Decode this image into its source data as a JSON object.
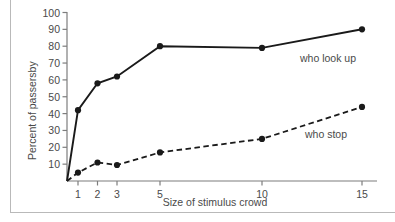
{
  "chart_data": {
    "type": "line",
    "title": "",
    "xlabel": "Size of stimulus crowd",
    "ylabel": "Percent of passersby",
    "x": [
      1,
      2,
      3,
      5,
      10,
      15
    ],
    "xtick_labels": [
      "1",
      "2",
      "3",
      "5",
      "10",
      "15"
    ],
    "ytick_labels": [
      "10",
      "20",
      "30",
      "40",
      "50",
      "60",
      "70",
      "80",
      "90",
      "100"
    ],
    "ylim": [
      0,
      100
    ],
    "grid": false,
    "legend_position": "inline-right",
    "series": [
      {
        "name": "who look up",
        "style": "solid",
        "marker": "filled-circle",
        "color": "#1a1a1a",
        "values": [
          42,
          58,
          62,
          80,
          79,
          90
        ]
      },
      {
        "name": "who stop",
        "style": "dashed",
        "marker": "filled-circle",
        "color": "#1a1a1a",
        "values": [
          5,
          11,
          9.5,
          17,
          25,
          44
        ]
      }
    ],
    "annotations": [
      {
        "text": "who look up",
        "series": "who look up"
      },
      {
        "text": "who stop",
        "series": "who stop"
      }
    ]
  },
  "axes": {
    "y_axis_name": "y-axis",
    "x_axis_name": "x-axis"
  }
}
